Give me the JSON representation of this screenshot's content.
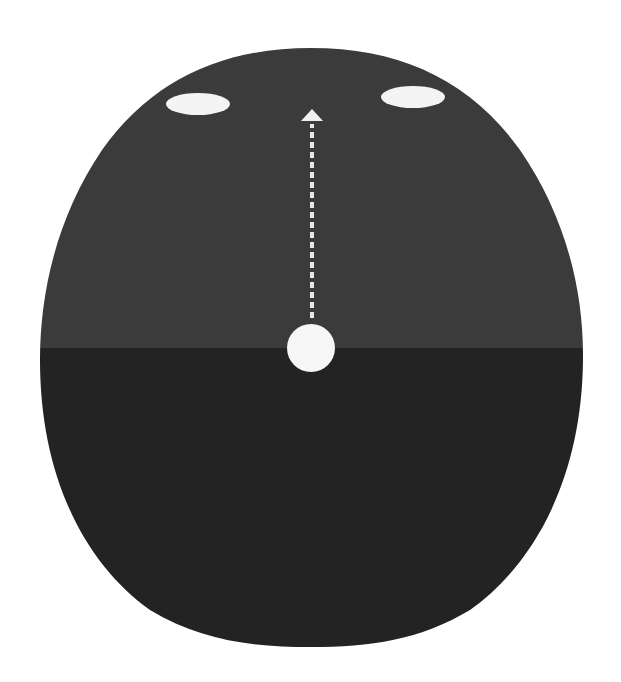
{
  "diagram": {
    "colors": {
      "background": "#ffffff",
      "upper_region": "#3b3b3b",
      "lower_region": "#232323",
      "markers": "#f4f4f4"
    },
    "elements": [
      {
        "id": "left-eye",
        "shape": "ellipse",
        "cx": 198,
        "cy": 104,
        "rx": 32,
        "ry": 11
      },
      {
        "id": "right-eye",
        "shape": "ellipse",
        "cx": 413,
        "cy": 97,
        "rx": 32,
        "ry": 11
      },
      {
        "id": "center-dot",
        "shape": "circle",
        "cx": 311,
        "cy": 348,
        "r": 24
      },
      {
        "id": "direction-arrow",
        "shape": "dashed-arrow",
        "x": 312,
        "y_from": 318,
        "y_to": 110,
        "direction": "up"
      }
    ],
    "split_line_y": 348
  }
}
